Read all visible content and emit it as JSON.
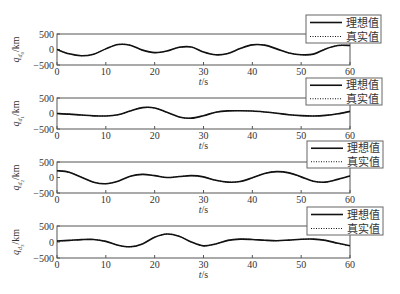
{
  "chart_data": [
    {
      "type": "line",
      "panel": 1,
      "ylabel_main": "q",
      "ylabel_sub": "d0",
      "ylabel_unit": "/km",
      "xlabel": "t/s",
      "xlim": [
        0,
        60
      ],
      "ylim": [
        -500,
        500
      ],
      "xticks": [
        0,
        10,
        20,
        30,
        40,
        50,
        60
      ],
      "yticks": [
        -500,
        0,
        500
      ],
      "grid": false,
      "legend": {
        "position": "upper-right-outside",
        "entries": [
          "理想值",
          "真实值"
        ]
      },
      "x": [
        0,
        2.5,
        5,
        7.5,
        10,
        12.5,
        15,
        17.5,
        20,
        22.5,
        25,
        27.5,
        30,
        32.5,
        35,
        37.5,
        40,
        42.5,
        45,
        47.5,
        50,
        52.5,
        55,
        57.5,
        60
      ],
      "series": [
        {
          "name": "理想值",
          "style": "solid",
          "values": [
            0,
            -140,
            -200,
            -150,
            20,
            160,
            140,
            -20,
            -100,
            -50,
            70,
            80,
            -80,
            -170,
            -130,
            30,
            150,
            140,
            20,
            -110,
            -170,
            -150,
            20,
            130,
            130
          ]
        },
        {
          "name": "真实值",
          "style": "dotted",
          "values": [
            0,
            -140,
            -200,
            -150,
            20,
            160,
            140,
            -20,
            -100,
            -50,
            70,
            80,
            -80,
            -170,
            -130,
            30,
            150,
            140,
            20,
            -110,
            -170,
            -150,
            20,
            130,
            130
          ]
        }
      ]
    },
    {
      "type": "line",
      "panel": 2,
      "ylabel_main": "q",
      "ylabel_sub": "d1",
      "ylabel_unit": "/km",
      "xlabel": "t/s",
      "xlim": [
        0,
        60
      ],
      "ylim": [
        -500,
        500
      ],
      "xticks": [
        0,
        10,
        20,
        30,
        40,
        50,
        60
      ],
      "yticks": [
        -500,
        0,
        500
      ],
      "grid": false,
      "legend": {
        "position": "upper-right-outside",
        "entries": [
          "理想值",
          "真实值"
        ]
      },
      "x": [
        0,
        2.5,
        5,
        7.5,
        10,
        12.5,
        15,
        17.5,
        20,
        22.5,
        25,
        27.5,
        30,
        32.5,
        35,
        37.5,
        40,
        42.5,
        45,
        47.5,
        50,
        52.5,
        55,
        57.5,
        60
      ],
      "series": [
        {
          "name": "理想值",
          "style": "solid",
          "values": [
            0,
            -20,
            -50,
            -75,
            -80,
            -40,
            80,
            190,
            180,
            40,
            -110,
            -150,
            -70,
            40,
            85,
            90,
            80,
            50,
            10,
            -40,
            -70,
            -80,
            -60,
            -10,
            70
          ]
        },
        {
          "name": "真实值",
          "style": "dotted",
          "values": [
            0,
            -20,
            -50,
            -75,
            -80,
            -40,
            80,
            190,
            180,
            40,
            -110,
            -150,
            -70,
            40,
            85,
            90,
            80,
            50,
            10,
            -40,
            -70,
            -80,
            -60,
            -10,
            70
          ]
        }
      ]
    },
    {
      "type": "line",
      "panel": 3,
      "ylabel_main": "q",
      "ylabel_sub": "d2",
      "ylabel_unit": "/km",
      "xlabel": "t/s",
      "xlim": [
        0,
        60
      ],
      "ylim": [
        -500,
        500
      ],
      "xticks": [
        0,
        10,
        20,
        30,
        40,
        50,
        60
      ],
      "yticks": [
        -500,
        0,
        500
      ],
      "grid": false,
      "legend": {
        "position": "upper-right-outside",
        "entries": [
          "理想值",
          "真实值"
        ]
      },
      "x": [
        0,
        2.5,
        5,
        7.5,
        10,
        12.5,
        15,
        17.5,
        20,
        22.5,
        25,
        27.5,
        30,
        32.5,
        35,
        37.5,
        40,
        42.5,
        45,
        47.5,
        50,
        52.5,
        55,
        57.5,
        60
      ],
      "series": [
        {
          "name": "理想值",
          "style": "solid",
          "values": [
            220,
            170,
            10,
            -150,
            -200,
            -120,
            40,
            100,
            60,
            0,
            30,
            60,
            20,
            -90,
            -150,
            -130,
            -10,
            130,
            190,
            150,
            20,
            -120,
            -150,
            -60,
            50
          ]
        },
        {
          "name": "真实值",
          "style": "dotted",
          "values": [
            220,
            170,
            10,
            -150,
            -200,
            -120,
            40,
            100,
            60,
            0,
            30,
            60,
            20,
            -90,
            -150,
            -130,
            -10,
            130,
            190,
            150,
            20,
            -120,
            -150,
            -60,
            50
          ]
        }
      ]
    },
    {
      "type": "line",
      "panel": 4,
      "ylabel_main": "q",
      "ylabel_sub": "d3",
      "ylabel_unit": "/km",
      "xlabel": "t/s",
      "xlim": [
        0,
        60
      ],
      "ylim": [
        -500,
        500
      ],
      "xticks": [
        0,
        10,
        20,
        30,
        40,
        50,
        60
      ],
      "yticks": [
        -500,
        0,
        500
      ],
      "grid": false,
      "legend": {
        "position": "upper-right-outside",
        "entries": [
          "理想值",
          "真实值"
        ]
      },
      "x": [
        0,
        2.5,
        5,
        7.5,
        10,
        12.5,
        15,
        17.5,
        20,
        22.5,
        25,
        27.5,
        30,
        32.5,
        35,
        37.5,
        40,
        42.5,
        45,
        47.5,
        50,
        52.5,
        55,
        57.5,
        60
      ],
      "series": [
        {
          "name": "理想值",
          "style": "solid",
          "values": [
            30,
            50,
            75,
            80,
            20,
            -100,
            -150,
            -60,
            150,
            250,
            180,
            0,
            -120,
            -60,
            50,
            90,
            80,
            55,
            40,
            60,
            85,
            90,
            50,
            -40,
            -120
          ]
        },
        {
          "name": "真实值",
          "style": "dotted",
          "values": [
            30,
            50,
            75,
            80,
            20,
            -100,
            -150,
            -60,
            150,
            250,
            180,
            0,
            -120,
            -60,
            50,
            90,
            80,
            55,
            40,
            60,
            85,
            90,
            50,
            -40,
            -120
          ]
        }
      ]
    }
  ],
  "layout": {
    "plot_left": 57,
    "plot_right": 350,
    "panels": [
      {
        "top": 34,
        "bottom": 65,
        "legend": {
          "x": 306,
          "y": 15,
          "w": 75,
          "h": 28
        }
      },
      {
        "top": 98,
        "bottom": 129,
        "legend": {
          "x": 306,
          "y": 78,
          "w": 76,
          "h": 27
        }
      },
      {
        "top": 162,
        "bottom": 193,
        "legend": {
          "x": 307,
          "y": 141,
          "w": 76,
          "h": 27
        }
      },
      {
        "top": 226,
        "bottom": 258,
        "legend": {
          "x": 307,
          "y": 207,
          "w": 76,
          "h": 28
        }
      }
    ]
  },
  "colors": {
    "axis": "#555555",
    "line": "#111111",
    "legend_border": "#666666",
    "text": "#333333"
  }
}
